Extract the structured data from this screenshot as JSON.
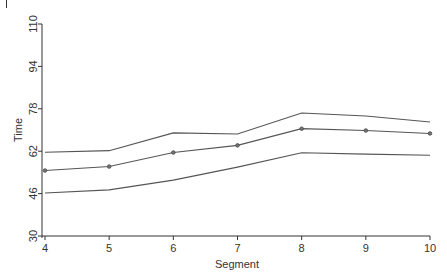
{
  "chart_data": {
    "type": "line",
    "title": "",
    "xlabel": "Segment",
    "ylabel": "Time",
    "x": [
      4,
      5,
      6,
      7,
      8,
      9,
      10
    ],
    "xticks": [
      "4",
      "5",
      "6",
      "7",
      "8",
      "9",
      "10"
    ],
    "yticks": [
      "30",
      "46",
      "62",
      "78",
      "94",
      "110"
    ],
    "ylim": [
      30,
      110
    ],
    "xlim": [
      4,
      10
    ],
    "grid": false,
    "legend": null,
    "series": [
      {
        "name": "Upper bound",
        "values": [
          61.6,
          62.2,
          68.9,
          68.5,
          76.4,
          75.3,
          73.0
        ],
        "markers": false
      },
      {
        "name": "Estimate",
        "values": [
          54.7,
          56.2,
          61.5,
          64.2,
          70.5,
          69.8,
          68.7
        ],
        "markers": true
      },
      {
        "name": "Lower bound",
        "values": [
          46.2,
          47.4,
          51.1,
          56.0,
          61.4,
          60.9,
          60.5
        ],
        "markers": false
      }
    ]
  }
}
